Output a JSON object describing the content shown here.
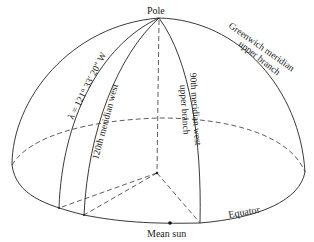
{
  "figure": {
    "labels": {
      "pole": "Pole",
      "greenwich_line1": "Greenwich meridian",
      "greenwich_line2": "upper branch",
      "meridian_90_line1": "90th meridian west",
      "meridian_90_line2": "upper branch",
      "meridian_120": "120th meridian west",
      "longitude": "λ = 121° 33′ 20″ W",
      "equator": "Equator",
      "mean_sun": "Mean sun"
    },
    "colors": {
      "line": "#222222",
      "background": "#ffffff"
    }
  }
}
